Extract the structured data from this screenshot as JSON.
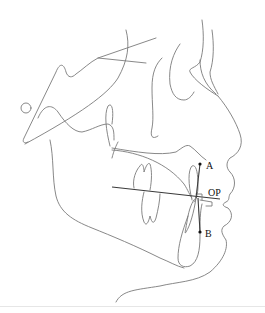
{
  "diagram": {
    "type": "cephalometric-tracing",
    "view": "lateral profile, facing right",
    "labels": {
      "point_a": "A",
      "point_b": "B",
      "occlusal_plane": "OP"
    },
    "colors": {
      "tracing": "#7a7a7a",
      "reference_lines": "#3a3a3a",
      "points": "#111111",
      "background": "#ffffff"
    }
  }
}
